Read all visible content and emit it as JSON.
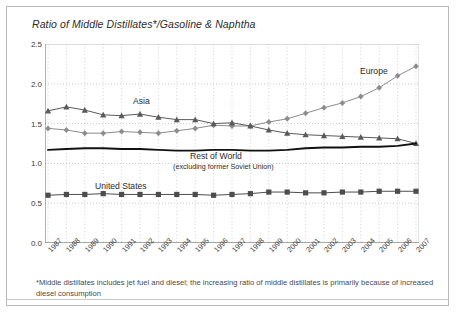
{
  "title": "Ratio of Middle Distillates*/Gasoline & Naphtha",
  "footnote": "*Middle distillates includes jet fuel and diesel; the increasing ratio of middle distillates is primarily because of increased diesel consumption",
  "labels": {
    "europe": "Europe",
    "asia": "Asia",
    "rest_of_world": "Rest of World",
    "rest_of_world_sub": "(excluding former Soviet Union)",
    "united_states": "United States"
  },
  "colors": {
    "europe": "#8c8c8c",
    "asia": "#5a5a5a",
    "rest_of_world": "#111111",
    "united_states": "#4d4d4d",
    "grid": "#bdbdbd",
    "axis": "#6b6b6b",
    "frame": "#b9b9b9",
    "text": "#2b2b2b"
  },
  "chart_data": {
    "type": "line",
    "title": "Ratio of Middle Distillates*/Gasoline & Naphtha",
    "xlabel": "",
    "ylabel": "",
    "ylim": [
      0.0,
      2.5
    ],
    "yticks": [
      "0.0",
      "0.5",
      "1.0",
      "1.5",
      "2.0",
      "2.5"
    ],
    "ytick_values": [
      0.0,
      0.5,
      1.0,
      1.5,
      2.0,
      2.5
    ],
    "grid": true,
    "legend": "inline-annotations",
    "categories": [
      "1987",
      "1988",
      "1989",
      "1990",
      "1991",
      "1992",
      "1993",
      "1994",
      "1995",
      "1996",
      "1997",
      "1998",
      "1999",
      "2000",
      "2001",
      "2002",
      "2003",
      "2004",
      "2005",
      "2006",
      "2007"
    ],
    "series": [
      {
        "name": "Europe",
        "marker": "diamond",
        "values": [
          1.44,
          1.42,
          1.38,
          1.38,
          1.4,
          1.39,
          1.38,
          1.41,
          1.44,
          1.48,
          1.47,
          1.47,
          1.52,
          1.56,
          1.63,
          1.7,
          1.76,
          1.84,
          1.95,
          2.1,
          2.22
        ]
      },
      {
        "name": "Asia",
        "marker": "triangle",
        "values": [
          1.66,
          1.71,
          1.67,
          1.61,
          1.6,
          1.62,
          1.58,
          1.55,
          1.55,
          1.5,
          1.51,
          1.47,
          1.42,
          1.38,
          1.36,
          1.35,
          1.34,
          1.33,
          1.32,
          1.31,
          1.25
        ]
      },
      {
        "name": "Rest of World",
        "marker": "none",
        "values": [
          1.17,
          1.18,
          1.19,
          1.19,
          1.18,
          1.18,
          1.17,
          1.16,
          1.16,
          1.17,
          1.17,
          1.16,
          1.16,
          1.17,
          1.19,
          1.2,
          1.2,
          1.21,
          1.21,
          1.22,
          1.25
        ]
      },
      {
        "name": "United States",
        "marker": "square",
        "values": [
          0.6,
          0.61,
          0.61,
          0.62,
          0.61,
          0.61,
          0.61,
          0.61,
          0.61,
          0.6,
          0.61,
          0.62,
          0.64,
          0.64,
          0.63,
          0.63,
          0.64,
          0.64,
          0.65,
          0.65,
          0.65
        ]
      }
    ]
  }
}
